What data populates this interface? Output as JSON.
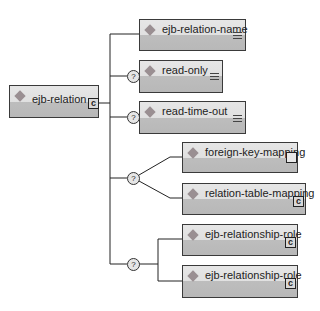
{
  "diagram": {
    "root": {
      "label": "ejb-relation",
      "icon": "sequence-icon"
    },
    "children": [
      {
        "label": "ejb-relation-name",
        "optional": false,
        "icon": "text-content-icon"
      },
      {
        "label": "read-only",
        "optional": true,
        "icon": "text-content-icon"
      },
      {
        "label": "read-time-out",
        "optional": true,
        "icon": "text-content-icon"
      },
      {
        "choice": {
          "optional": true,
          "marker": "?",
          "options": [
            {
              "label": "foreign-key-mapping",
              "icon": "empty-element-icon"
            },
            {
              "label": "relation-table-mapping",
              "icon": "sequence-icon"
            }
          ]
        }
      },
      {
        "sequence": {
          "optional": true,
          "marker": "?",
          "items": [
            {
              "label": "ejb-relationship-role",
              "icon": "sequence-icon"
            },
            {
              "label": "ejb-relationship-role",
              "icon": "sequence-icon"
            }
          ]
        }
      }
    ],
    "optional_marker": "?",
    "sequence_glyph": "c",
    "colors": {
      "box_top": "#e3e3e3",
      "box_bottom": "#bababa",
      "diamond": "#9a8f92",
      "border": "#3a3a3a"
    }
  }
}
